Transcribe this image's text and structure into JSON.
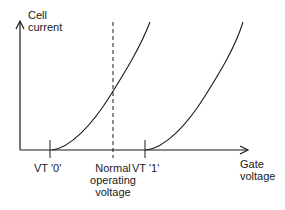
{
  "diagram": {
    "y_axis_label_line1": "Cell",
    "y_axis_label_line2": "current",
    "x_axis_label_line1": "Gate",
    "x_axis_label_line2": "voltage",
    "vt0_label": "VT '0'",
    "vt1_label": "VT '1'",
    "normal_label_line1": "Normal",
    "normal_label_line2": "operating",
    "normal_label_line3": "voltage",
    "colors": {
      "ink": "#1a1a1a",
      "background": "#ffffff"
    }
  }
}
